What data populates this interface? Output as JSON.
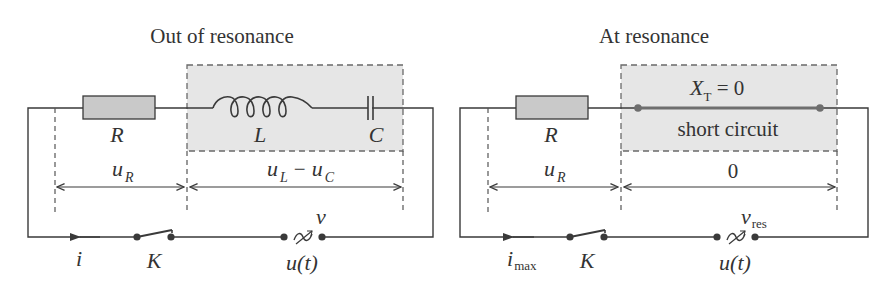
{
  "panels": [
    {
      "id": "out-of-resonance",
      "title": "Out of resonance",
      "components": {
        "resistor": "R",
        "inductor": "L",
        "capacitor": "C",
        "switch": "K",
        "source": "u(t)"
      },
      "voltage_labels": {
        "resistor_main": "u",
        "resistor_sub": "R",
        "reactive_main_1": "u",
        "reactive_sub_1": "L",
        "reactive_minus": "−",
        "reactive_main_2": "u",
        "reactive_sub_2": "C"
      },
      "current_label": {
        "main": "i",
        "sub": ""
      },
      "frequency_label": {
        "main": "ν",
        "sub": ""
      }
    },
    {
      "id": "at-resonance",
      "title": "At resonance",
      "components": {
        "resistor": "R",
        "switch": "K",
        "source": "u(t)"
      },
      "reactance_label": {
        "main": "X",
        "sub": "T",
        "rest": " = 0"
      },
      "short_circuit_label": "short circuit",
      "voltage_labels": {
        "resistor_main": "u",
        "resistor_sub": "R",
        "reactive_value": "0"
      },
      "current_label": {
        "main": "i",
        "sub": "max"
      },
      "frequency_label": {
        "main": "ν",
        "sub": "res"
      }
    }
  ],
  "colors": {
    "wire": "#3a3a3a",
    "dashed_box_fill": "#e6e6e6",
    "dashed_box_stroke": "#6a6a6a",
    "resistor_fill": "#c9c9c9",
    "short_wire": "#6e6e6e",
    "text": "#333333"
  }
}
